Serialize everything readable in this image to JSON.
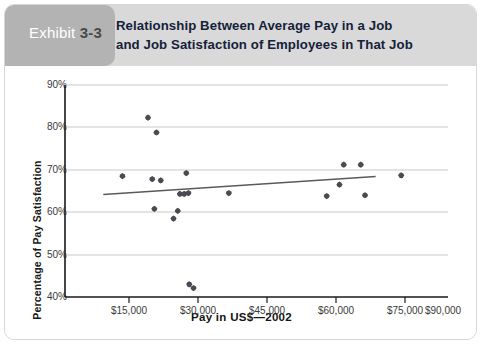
{
  "exhibit": {
    "word": "Exhibit",
    "number": "3-3"
  },
  "title": {
    "line1": "Relationship Between Average Pay in a Job",
    "line2": "and Job Satisfaction of Employees in That Job"
  },
  "colors": {
    "header_band": "#d9d9d9",
    "exhibit_tab": "#b3b3b3",
    "exhibit_word": "#ffffff",
    "exhibit_number": "#4a4a4a",
    "title_text": "#15213a",
    "axis_line": "#1a1a1a",
    "gridline": "#c9c9c9",
    "marker": "#4a4a52",
    "trendline": "#5a5a5a",
    "card_border": "#d6d6d6",
    "page_background": "#ffffff"
  },
  "chart_data": {
    "type": "scatter",
    "title": "Relationship Between Average Pay in a Job and Job Satisfaction of Employees in That Job",
    "xlabel": "Pay in US$—2002",
    "ylabel": "Percentage of Pay Satisfaction",
    "xlim": [
      0,
      90000
    ],
    "ylim": [
      40,
      90
    ],
    "xticks": [
      15000,
      30000,
      45000,
      60000,
      75000,
      90000
    ],
    "xticklabels": [
      "$15,000",
      "$30,000",
      "$45,000",
      "$60,000",
      "$75,000",
      "$90,000"
    ],
    "yticks": [
      40,
      50,
      60,
      70,
      80,
      90
    ],
    "yticklabels": [
      "40%",
      "50%",
      "60%",
      "70%",
      "80%",
      "90%"
    ],
    "grid": "horizontal",
    "legend": null,
    "points": [
      {
        "x": 13500,
        "y": 68.5
      },
      {
        "x": 19500,
        "y": 82.3
      },
      {
        "x": 20500,
        "y": 67.8
      },
      {
        "x": 21500,
        "y": 78.8
      },
      {
        "x": 22500,
        "y": 67.5
      },
      {
        "x": 21000,
        "y": 60.8
      },
      {
        "x": 25500,
        "y": 58.5
      },
      {
        "x": 27000,
        "y": 64.3
      },
      {
        "x": 28000,
        "y": 64.3
      },
      {
        "x": 29000,
        "y": 64.5
      },
      {
        "x": 26500,
        "y": 60.3
      },
      {
        "x": 28500,
        "y": 69.2
      },
      {
        "x": 29200,
        "y": 43.0
      },
      {
        "x": 30200,
        "y": 42.1
      },
      {
        "x": 38500,
        "y": 64.5
      },
      {
        "x": 61500,
        "y": 63.8
      },
      {
        "x": 64500,
        "y": 66.5
      },
      {
        "x": 65500,
        "y": 71.2
      },
      {
        "x": 69500,
        "y": 71.2
      },
      {
        "x": 70500,
        "y": 64.0
      },
      {
        "x": 79000,
        "y": 68.7
      }
    ],
    "trendline": {
      "x_start": 9000,
      "y_start": 64.2,
      "x_end": 73000,
      "y_end": 68.4
    }
  }
}
